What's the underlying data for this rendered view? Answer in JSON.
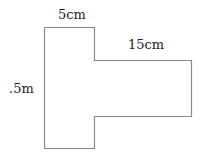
{
  "figure": {
    "shape": "T-shaped polygon (rotated T)",
    "stroke_color": "#8a8a8a",
    "labels": {
      "top_width": "5cm",
      "arm_length": "15cm",
      "height": ".5m"
    }
  }
}
